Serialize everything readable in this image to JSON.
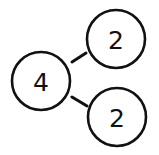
{
  "diagram": {
    "type": "number-bond",
    "colors": {
      "stroke": "#111111",
      "fill": "#ffffff",
      "text": "#111111"
    },
    "whole": {
      "label": "4",
      "cx": 41,
      "cy": 81,
      "r": 29
    },
    "parts": [
      {
        "label": "2",
        "cx": 116,
        "cy": 39,
        "r": 29
      },
      {
        "label": "2",
        "cx": 117,
        "cy": 117,
        "r": 29
      }
    ],
    "connectors": [
      {
        "x1": 72,
        "y1": 62,
        "x2": 86,
        "y2": 53
      },
      {
        "x1": 72,
        "y1": 97,
        "x2": 87,
        "y2": 106
      }
    ]
  }
}
